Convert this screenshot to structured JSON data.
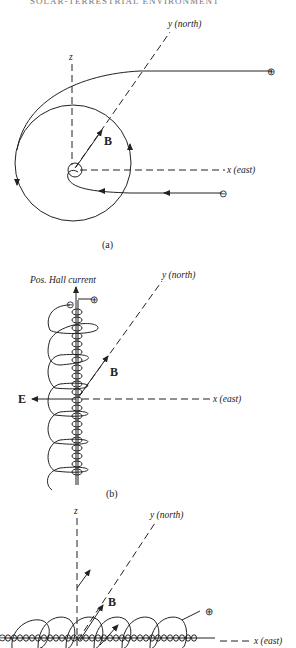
{
  "header_text": "SOLAR-TERRESTRIAL ENVIRONMENT",
  "panels": [
    {
      "id": "a",
      "caption": "(a)",
      "axes": {
        "x": "x (east)",
        "y": "y (north)",
        "z": "z"
      },
      "field_label": "B",
      "charges": [
        "⊕",
        "⊖"
      ]
    },
    {
      "id": "b",
      "caption": "(b)",
      "axes": {
        "x": "x (east)",
        "y": "y (north)"
      },
      "field_label": "B",
      "electric_label": "E",
      "current_label": "Pos. Hall current",
      "charges": [
        "⊕",
        "⊖"
      ]
    },
    {
      "id": "c",
      "caption": "",
      "axes": {
        "x": "x (east)",
        "y": "y (north)",
        "z": "z"
      },
      "field_label": "B",
      "charges": [
        "⊕",
        "⊖"
      ]
    }
  ]
}
